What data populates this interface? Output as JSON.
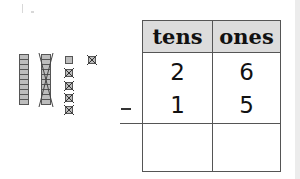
{
  "problem": {
    "operation": "subtraction",
    "operator_symbol": "−",
    "table": {
      "headers": [
        "tens",
        "ones"
      ],
      "rows": [
        {
          "tens": "2",
          "ones": "6"
        },
        {
          "tens": "1",
          "ones": "5"
        }
      ],
      "answer": {
        "tens": "",
        "ones": ""
      }
    }
  },
  "model": {
    "tens_rods": 2,
    "crossed_out_rods": 1,
    "ones_cubes": 6,
    "crossed_out_cubes": 5,
    "block_color": "#bdbdbd",
    "outline_color": "#555555"
  }
}
